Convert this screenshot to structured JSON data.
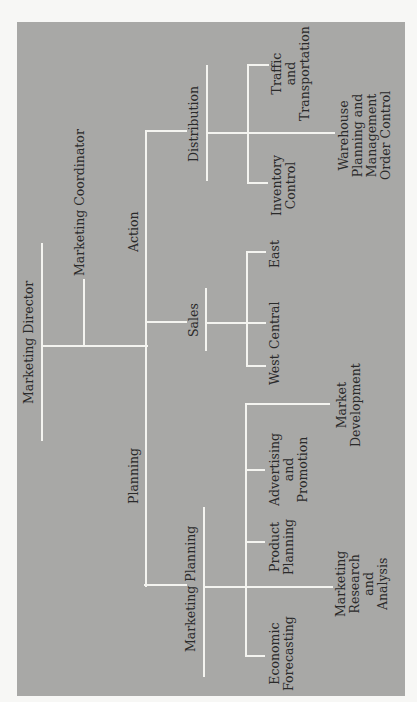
{
  "chart": {
    "background_color": "#a8a8a6",
    "line_color": "#f4f4f0",
    "text_color": "#2a2a2a"
  },
  "nodes": {
    "director": "Marketing Director",
    "coordinator": "Marketing Coordinator",
    "action": "Action",
    "planning": "Planning",
    "distribution": "Distribution",
    "sales": "Sales",
    "marketing_planning": "Marketing Planning",
    "traffic": "Traffic\nand\nTransportation",
    "warehouse": "Warehouse\nPlanning and\nManagement\nOrder Control",
    "inventory": "Inventory\nControl",
    "east": "East",
    "central": "Central",
    "west": "West",
    "market_development": "Market\nDevelopment",
    "advertising": "Advertising\nand\nPromotion",
    "product_planning": "Product\nPlanning",
    "research": "Marketing\nResearch\nand\nAnalysis",
    "forecasting": "Economic\nForecasting"
  },
  "hierarchy": {
    "name": "Marketing Director",
    "children": [
      {
        "name": "Marketing Coordinator"
      },
      {
        "name": "Action",
        "children": [
          {
            "name": "Distribution",
            "children": [
              {
                "name": "Traffic and Transportation"
              },
              {
                "name": "Warehouse Planning and Management Order Control"
              },
              {
                "name": "Inventory Control"
              }
            ]
          },
          {
            "name": "Sales",
            "children": [
              {
                "name": "East"
              },
              {
                "name": "Central"
              },
              {
                "name": "West"
              }
            ]
          }
        ]
      },
      {
        "name": "Planning",
        "children": [
          {
            "name": "Marketing Planning",
            "children": [
              {
                "name": "Market Development"
              },
              {
                "name": "Advertising and Promotion"
              },
              {
                "name": "Product Planning"
              },
              {
                "name": "Marketing Research and Analysis"
              },
              {
                "name": "Economic Forecasting"
              }
            ]
          }
        ]
      }
    ]
  }
}
